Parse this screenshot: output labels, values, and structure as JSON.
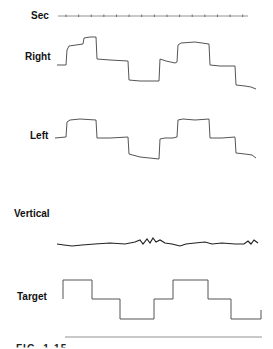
{
  "labels": {
    "sec": "Sec",
    "right": "Right",
    "left": "Left",
    "vertical": "Vertical",
    "target": "Target"
  },
  "caption_fragment": "FIG. 1-15",
  "chart_data": {
    "type": "line",
    "title": "",
    "xlabel": "Sec",
    "time_axis": {
      "tick_count": 15,
      "x_start": 58,
      "x_end": 248
    },
    "grid": false,
    "series": [
      {
        "name": "Right",
        "points": [
          [
            57,
            65
          ],
          [
            66,
            65
          ],
          [
            67,
            50
          ],
          [
            69,
            46
          ],
          [
            83,
            44
          ],
          [
            84,
            38
          ],
          [
            90,
            37
          ],
          [
            96,
            37
          ],
          [
            97,
            59
          ],
          [
            110,
            60
          ],
          [
            128,
            61
          ],
          [
            129,
            80
          ],
          [
            140,
            81
          ],
          [
            159,
            81
          ],
          [
            160,
            59
          ],
          [
            166,
            61
          ],
          [
            175,
            63
          ],
          [
            177,
            62
          ],
          [
            178,
            45
          ],
          [
            181,
            43
          ],
          [
            195,
            42
          ],
          [
            209,
            44
          ],
          [
            210,
            65
          ],
          [
            220,
            66
          ],
          [
            235,
            66
          ],
          [
            236,
            85
          ],
          [
            245,
            86
          ],
          [
            251,
            87
          ],
          [
            256,
            89
          ]
        ]
      },
      {
        "name": "Left",
        "points": [
          [
            55,
            138
          ],
          [
            66,
            137
          ],
          [
            67,
            122
          ],
          [
            70,
            120
          ],
          [
            80,
            119
          ],
          [
            96,
            120
          ],
          [
            97,
            138
          ],
          [
            110,
            138
          ],
          [
            128,
            137
          ],
          [
            129,
            154
          ],
          [
            140,
            157
          ],
          [
            159,
            159
          ],
          [
            160,
            139
          ],
          [
            165,
            138
          ],
          [
            173,
            138
          ],
          [
            177,
            137
          ],
          [
            178,
            120
          ],
          [
            183,
            119
          ],
          [
            195,
            120
          ],
          [
            209,
            119
          ],
          [
            210,
            138
          ],
          [
            222,
            138
          ],
          [
            235,
            137
          ],
          [
            236,
            153
          ],
          [
            245,
            154
          ],
          [
            252,
            155
          ],
          [
            256,
            158
          ]
        ]
      },
      {
        "name": "Vertical",
        "points": [
          [
            57,
            244
          ],
          [
            64,
            245
          ],
          [
            72,
            246
          ],
          [
            82,
            245
          ],
          [
            95,
            244
          ],
          [
            110,
            243
          ],
          [
            125,
            244
          ],
          [
            135,
            242
          ],
          [
            140,
            240
          ],
          [
            143,
            244
          ],
          [
            147,
            239
          ],
          [
            150,
            243
          ],
          [
            153,
            238
          ],
          [
            156,
            242
          ],
          [
            160,
            240
          ],
          [
            165,
            243
          ],
          [
            172,
            244
          ],
          [
            180,
            246
          ],
          [
            186,
            244
          ],
          [
            195,
            243
          ],
          [
            205,
            242
          ],
          [
            212,
            244
          ],
          [
            222,
            243
          ],
          [
            235,
            244
          ],
          [
            244,
            244
          ],
          [
            248,
            241
          ],
          [
            251,
            244
          ],
          [
            254,
            240
          ],
          [
            258,
            243
          ]
        ]
      },
      {
        "name": "Target",
        "points": [
          [
            63,
            299
          ],
          [
            63,
            280
          ],
          [
            92,
            280
          ],
          [
            92,
            299
          ],
          [
            120,
            299
          ],
          [
            120,
            319
          ],
          [
            154,
            319
          ],
          [
            154,
            299
          ],
          [
            173,
            299
          ],
          [
            173,
            280
          ],
          [
            208,
            280
          ],
          [
            208,
            299
          ],
          [
            231,
            299
          ],
          [
            231,
            319
          ],
          [
            261,
            319
          ],
          [
            261,
            310
          ]
        ]
      }
    ],
    "baseline": {
      "x1": 65,
      "x2": 262,
      "y": 337
    }
  }
}
